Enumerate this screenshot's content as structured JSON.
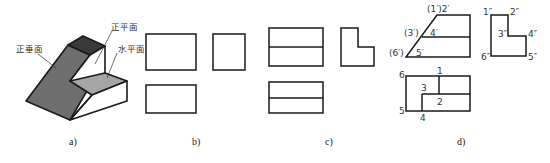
{
  "figure": {
    "panels": [
      {
        "id": "a",
        "caption": "a)",
        "description": "isometric view of stepped block with inclined face"
      },
      {
        "id": "b",
        "caption": "b)",
        "description": "three-view outline boxes"
      },
      {
        "id": "c",
        "caption": "c)",
        "description": "three views with horizontal division lines and L-shaped side view"
      },
      {
        "id": "d",
        "caption": "d)",
        "description": "completed three views with point labels"
      }
    ],
    "annotations_a": {
      "vertical_face": "正垂面",
      "frontal_face": "正平面",
      "horizontal_face": "水平面"
    },
    "labels_d": {
      "front": [
        "(1′)2′",
        "(3′)",
        "4′",
        "(6′)",
        "5′"
      ],
      "side": [
        "1″",
        "2″",
        "3″",
        "4″",
        "5″",
        "6″"
      ],
      "top": [
        "6",
        "1",
        "3",
        "2",
        "5",
        "4"
      ]
    },
    "colors": {
      "line": "#1a1a1a",
      "dark_face": "#3a3a3a",
      "mid_face": "#6e6e6e",
      "light_face": "#a6a6a6",
      "white_face": "#ffffff"
    }
  }
}
